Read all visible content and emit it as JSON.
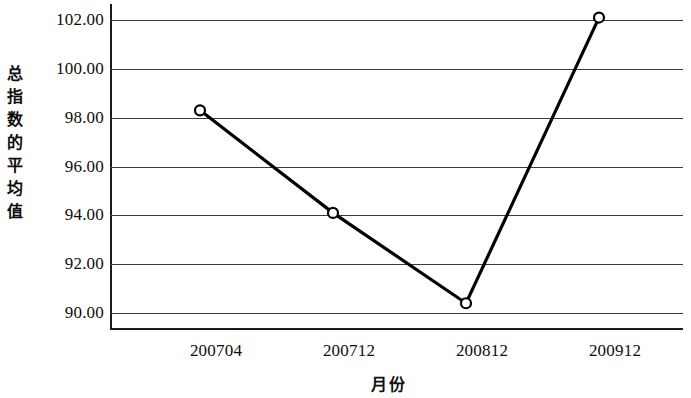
{
  "chart_data": {
    "type": "line",
    "title": "",
    "xlabel": "月份",
    "ylabel": "总指数的平均值",
    "categories": [
      "200704",
      "200712",
      "200812",
      "200912"
    ],
    "values": [
      98.3,
      94.1,
      90.4,
      102.1
    ],
    "series": [
      {
        "name": "总指数的平均值",
        "values": [
          98.3,
          94.1,
          90.4,
          102.1
        ]
      }
    ],
    "ylim": [
      90.0,
      102.0
    ],
    "ytick_labels": [
      "102.00",
      "100.00",
      "98.00",
      "96.00",
      "94.00",
      "92.00",
      "90.00"
    ],
    "ytick_values": [
      102.0,
      100.0,
      98.0,
      96.0,
      94.0,
      92.0,
      90.0
    ],
    "xtick_labels": [
      "200704",
      "200712",
      "200812",
      "200912"
    ],
    "grid": "horizontal",
    "legend": "none",
    "marker": "open-circle",
    "line_color": "#000000",
    "marker_fill": "#ffffff",
    "grid_color": "#3a3a3a",
    "axis_color": "#1a1a1a"
  }
}
